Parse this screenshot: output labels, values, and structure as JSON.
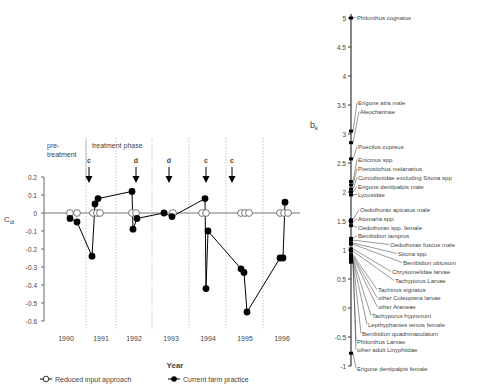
{
  "chart_data": [
    {
      "type": "line",
      "title": "",
      "xlabel": "Year",
      "ylabel": "C_dt",
      "ylim": [
        -0.6,
        0.2
      ],
      "yticks": [
        "0.2",
        "0.1",
        "0",
        "-0.1",
        "-0.2",
        "-0.3",
        "-0.4",
        "-0.5",
        "-0.6"
      ],
      "categories": [
        "1990",
        "1991",
        "1992",
        "1993",
        "1994",
        "1995",
        "1996"
      ],
      "phase_labels": {
        "pre": "pre-treatment",
        "treatment": "treatment phase"
      },
      "annotations": [
        {
          "label": "c",
          "year": "1991"
        },
        {
          "label": "d",
          "year": "1992"
        },
        {
          "label": "d",
          "year": "1993"
        },
        {
          "label": "c",
          "year": "1994"
        },
        {
          "label": "c",
          "year": "1995"
        }
      ],
      "legend": [
        "Reduced input approach",
        "Current farm practice"
      ],
      "series": [
        {
          "name": "Reduced input approach",
          "marker": "open-circle",
          "points": [
            {
              "year": "1990",
              "values": [
                0,
                0
              ]
            },
            {
              "year": "1991",
              "values": [
                0,
                0,
                0
              ]
            },
            {
              "year": "1992",
              "values": [
                0,
                0
              ]
            },
            {
              "year": "1993",
              "values": [
                0
              ]
            },
            {
              "year": "1994",
              "values": [
                0,
                0
              ]
            },
            {
              "year": "1995",
              "values": [
                0,
                0,
                0
              ]
            },
            {
              "year": "1996",
              "values": [
                0,
                0,
                0
              ]
            }
          ]
        },
        {
          "name": "Current farm practice",
          "marker": "filled-circle",
          "points": [
            {
              "year": "1990",
              "values": [
                -0.03,
                -0.05
              ]
            },
            {
              "year": "1991",
              "values": [
                -0.24,
                0.05,
                0.08
              ]
            },
            {
              "year": "1992",
              "values": [
                0.12,
                -0.09,
                -0.03
              ]
            },
            {
              "year": "1993",
              "values": [
                0.0,
                -0.02
              ]
            },
            {
              "year": "1994",
              "values": [
                0.08,
                -0.42,
                -0.1
              ]
            },
            {
              "year": "1995",
              "values": [
                -0.31,
                -0.33,
                -0.55
              ]
            },
            {
              "year": "1996",
              "values": [
                -0.25,
                -0.25,
                0.06
              ]
            }
          ]
        }
      ]
    },
    {
      "type": "scatter",
      "title": "",
      "ylabel": "b_k",
      "ylim": [
        -1,
        5
      ],
      "yticks": [
        "5",
        "4.5",
        "4",
        "3.5",
        "3",
        "2.5",
        "2",
        "1.5",
        "1",
        "0.5",
        "0",
        "-0.5",
        "-1"
      ],
      "species": [
        {
          "name": "Philonthus cognatus",
          "b": 5.0
        },
        {
          "name": "Erigone atra male",
          "b": 3.05
        },
        {
          "name": "Aleocharinae",
          "b": 2.85
        },
        {
          "name": "Poecilus cupreus",
          "b": 2.57
        },
        {
          "name": "Enicmus spp.",
          "b": 2.18
        },
        {
          "name": "Pterostichus melanarius",
          "b": 2.12
        },
        {
          "name": "Curculionidae excluding Sitona spp",
          "b": 2.05
        },
        {
          "name": "Erigone dentipalpis male",
          "b": 2.0
        },
        {
          "name": "Lycosidae",
          "b": 1.95
        },
        {
          "name": "Oedothorax apicatus male",
          "b": 1.52
        },
        {
          "name": "Atomaria spp.",
          "b": 1.48
        },
        {
          "name": "Oedothorax spp. female",
          "b": 1.42
        },
        {
          "name": "Bembidion lampros",
          "b": 1.2
        },
        {
          "name": "Oedothorax fuscus male",
          "b": 1.17
        },
        {
          "name": "Sitona spp.",
          "b": 1.12
        },
        {
          "name": "Bembidion obtusum",
          "b": 1.1
        },
        {
          "name": "Chrysomelidae larvae",
          "b": 1.02
        },
        {
          "name": "Tachyporus Larvae",
          "b": 0.98
        },
        {
          "name": "Tachinus signatus",
          "b": 0.92
        },
        {
          "name": "other Coleoptera larvae",
          "b": 0.9
        },
        {
          "name": "other Araneae",
          "b": 0.88
        },
        {
          "name": "Tachyporus hypnorum",
          "b": 0.85
        },
        {
          "name": "Lepthyphantes tenuis female",
          "b": 0.83
        },
        {
          "name": "Bembidion quadrimaculatum",
          "b": 0.82
        },
        {
          "name": "Philonthus Larvae",
          "b": 0.8
        },
        {
          "name": "other adult Linyphiidae",
          "b": 0.79
        },
        {
          "name": "Erigone dentipalpis female",
          "b": -0.78
        }
      ]
    }
  ]
}
